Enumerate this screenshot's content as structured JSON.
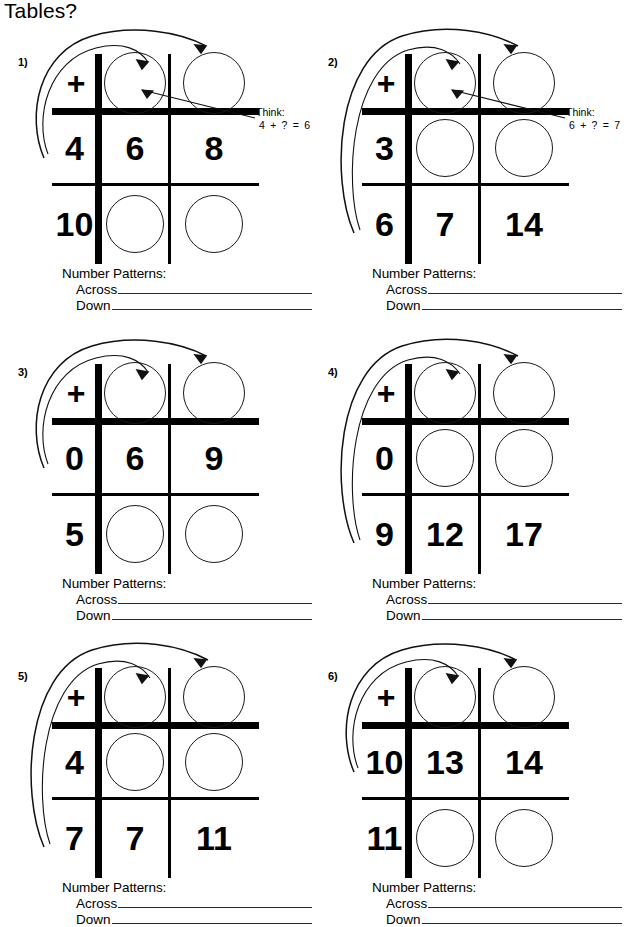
{
  "title": "Tables?",
  "labels": {
    "number_patterns": "Number Patterns:",
    "across": "Across",
    "down": "Down",
    "operator": "+",
    "think_word": "Think:"
  },
  "panels": [
    {
      "index": "1)",
      "operator": "+",
      "header": [
        "+",
        "",
        ""
      ],
      "middle": [
        "4",
        "6",
        "8"
      ],
      "bottom": [
        "10",
        "",
        ""
      ],
      "header_blanks": [
        false,
        true,
        true
      ],
      "middle_blanks": [
        false,
        false,
        false
      ],
      "bottom_blanks": [
        false,
        true,
        true
      ],
      "think": {
        "label": "Think:",
        "equation": "4 + ? = 6"
      },
      "number_patterns": {
        "title": "Number Patterns:",
        "across": "Across",
        "down": "Down"
      }
    },
    {
      "index": "2)",
      "operator": "+",
      "header": [
        "+",
        "",
        ""
      ],
      "middle": [
        "3",
        "",
        ""
      ],
      "bottom": [
        "6",
        "7",
        "14"
      ],
      "header_blanks": [
        false,
        true,
        true
      ],
      "middle_blanks": [
        false,
        true,
        true
      ],
      "bottom_blanks": [
        false,
        false,
        false
      ],
      "think": {
        "label": "Think:",
        "equation": "6 + ? = 7"
      },
      "number_patterns": {
        "title": "Number Patterns:",
        "across": "Across",
        "down": "Down"
      }
    },
    {
      "index": "3)",
      "operator": "+",
      "header": [
        "+",
        "",
        ""
      ],
      "middle": [
        "0",
        "6",
        "9"
      ],
      "bottom": [
        "5",
        "",
        ""
      ],
      "header_blanks": [
        false,
        true,
        true
      ],
      "middle_blanks": [
        false,
        false,
        false
      ],
      "bottom_blanks": [
        false,
        true,
        true
      ],
      "think": null,
      "number_patterns": {
        "title": "Number Patterns:",
        "across": "Across",
        "down": "Down"
      }
    },
    {
      "index": "4)",
      "operator": "+",
      "header": [
        "+",
        "",
        ""
      ],
      "middle": [
        "0",
        "",
        ""
      ],
      "bottom": [
        "9",
        "12",
        "17"
      ],
      "header_blanks": [
        false,
        true,
        true
      ],
      "middle_blanks": [
        false,
        true,
        true
      ],
      "bottom_blanks": [
        false,
        false,
        false
      ],
      "think": null,
      "number_patterns": {
        "title": "Number Patterns:",
        "across": "Across",
        "down": "Down"
      }
    },
    {
      "index": "5)",
      "operator": "+",
      "header": [
        "+",
        "",
        ""
      ],
      "middle": [
        "4",
        "",
        ""
      ],
      "bottom": [
        "7",
        "7",
        "11"
      ],
      "header_blanks": [
        false,
        true,
        true
      ],
      "middle_blanks": [
        false,
        true,
        true
      ],
      "bottom_blanks": [
        false,
        false,
        false
      ],
      "think": null,
      "number_patterns": {
        "title": "Number Patterns:",
        "across": "Across",
        "down": "Down"
      }
    },
    {
      "index": "6)",
      "operator": "+",
      "header": [
        "+",
        "",
        ""
      ],
      "middle": [
        "10",
        "13",
        "14"
      ],
      "bottom": [
        "11",
        "",
        ""
      ],
      "header_blanks": [
        false,
        true,
        true
      ],
      "middle_blanks": [
        false,
        false,
        false
      ],
      "bottom_blanks": [
        false,
        true,
        true
      ],
      "think": null,
      "number_patterns": {
        "title": "Number Patterns:",
        "across": "Across",
        "down": "Down"
      }
    }
  ],
  "colors": {
    "ink": "#000000",
    "paper": "#ffffff",
    "rule": "#2a2a2a"
  }
}
